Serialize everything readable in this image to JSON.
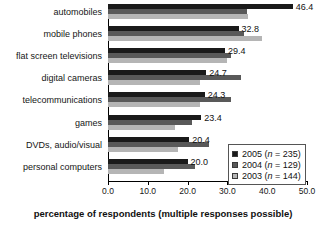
{
  "chart_data": {
    "type": "bar",
    "orientation": "horizontal",
    "title": "",
    "xlabel": "percentage of respondents (multiple responses possible)",
    "ylabel": "",
    "xlim": [
      0.0,
      50.0
    ],
    "xticks": [
      "0.0",
      "10.0",
      "20.0",
      "30.0",
      "40.0",
      "50.0"
    ],
    "xtick_values": [
      0,
      10,
      20,
      30,
      40,
      50
    ],
    "grid": false,
    "legend_position": "inside-right-lower",
    "categories": [
      "automobiles",
      "mobile phones",
      "flat screen televisions",
      "digital cameras",
      "telecommunications",
      "games",
      "DVDs, audio/visual",
      "personal computers"
    ],
    "series": [
      {
        "name": "2005",
        "legend_label": "2005 (n = 235)",
        "n": 235,
        "color": "#1a1a1a",
        "values": [
          46.4,
          32.8,
          29.4,
          24.7,
          24.3,
          23.4,
          20.4,
          20.0
        ],
        "data_labels": [
          "46.4",
          "32.8",
          "29.4",
          "24.7",
          "24.3",
          "23.4",
          "20.4",
          "20.0"
        ]
      },
      {
        "name": "2004",
        "legend_label": "2004 (n = 129)",
        "n": 129,
        "color": "#595959",
        "values": [
          35.0,
          34.2,
          31.0,
          33.3,
          31.0,
          21.0,
          25.3,
          21.8
        ]
      },
      {
        "name": "2003",
        "legend_label": "2003 (n = 144)",
        "n": 144,
        "color": "#b5b5b5",
        "values": [
          35.2,
          38.7,
          29.8,
          23.0,
          23.0,
          16.8,
          17.6,
          14.0
        ]
      }
    ]
  },
  "legend": {
    "rows": [
      {
        "year": "2005",
        "text": "2005 (",
        "n_label": "n",
        "tail": " = 235)",
        "color": "#1a1a1a"
      },
      {
        "year": "2004",
        "text": "2004 (",
        "n_label": "n",
        "tail": " = 129)",
        "color": "#595959"
      },
      {
        "year": "2003",
        "text": "2003 (",
        "n_label": "n",
        "tail": " = 144)",
        "color": "#b5b5b5"
      }
    ]
  }
}
